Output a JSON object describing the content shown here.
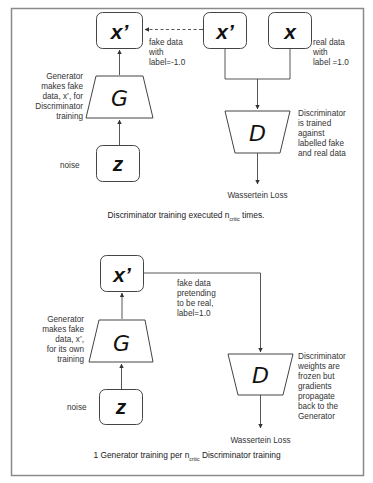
{
  "colors": {
    "frame": "#8a8a8a",
    "stroke": "#444444",
    "text": "#333333",
    "background": "#ffffff"
  },
  "panel1": {
    "fake_box": {
      "symbol": "x’"
    },
    "disc_fake_box": {
      "symbol": "x’"
    },
    "real_box": {
      "symbol": "x"
    },
    "generator": {
      "symbol": "G"
    },
    "noise_box": {
      "symbol": "z"
    },
    "discriminator": {
      "symbol": "D"
    },
    "generator_note": [
      "Generator",
      "makes fake",
      "data, x’, for",
      "Discriminator",
      "training"
    ],
    "fake_note": [
      "fake data",
      "with",
      "label=-1.0"
    ],
    "real_note": [
      "real data",
      "with",
      "label =1.0"
    ],
    "disc_note": [
      "Discriminator",
      "is trained",
      "against",
      "labelled fake",
      "and real data"
    ],
    "noise_label": "noise",
    "loss_label": "Wassertein Loss",
    "caption": {
      "prefix": "Discriminator training executed n",
      "subscript": "critic",
      "suffix": " times."
    }
  },
  "panel2": {
    "fake_box": {
      "symbol": "x’"
    },
    "generator": {
      "symbol": "G"
    },
    "noise_box": {
      "symbol": "z"
    },
    "discriminator": {
      "symbol": "D"
    },
    "generator_note": [
      "Generator",
      "makes fake",
      "data, x’,",
      "for its own",
      "training"
    ],
    "fake_note": [
      "fake data",
      "pretending",
      "to be real,",
      "label=1.0"
    ],
    "disc_note": [
      "Discriminator",
      "weights are",
      "frozen but",
      "gradients",
      "propagate",
      "back to the",
      "Generator"
    ],
    "noise_label": "noise",
    "loss_label": "Wassertein Loss",
    "caption": {
      "prefix": "1 Generator training per n",
      "subscript": "critic",
      "suffix": " Discriminator training"
    }
  }
}
